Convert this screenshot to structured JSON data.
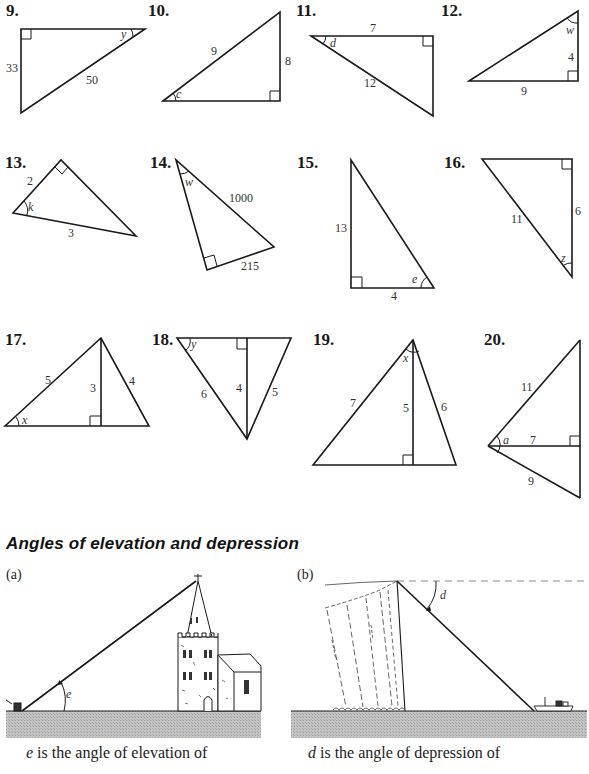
{
  "problems": [
    {
      "num": "9.",
      "labels": [
        {
          "t": "33",
          "x": 6,
          "y": 72
        },
        {
          "t": "50",
          "x": 86,
          "y": 84
        },
        {
          "t": "y",
          "x": 121,
          "y": 38,
          "i": true
        }
      ]
    },
    {
      "num": "10.",
      "labels": [
        {
          "t": "9",
          "x": 211,
          "y": 55
        },
        {
          "t": "8",
          "x": 285,
          "y": 65
        },
        {
          "t": "c",
          "x": 176,
          "y": 98,
          "i": true
        }
      ]
    },
    {
      "num": "11.",
      "labels": [
        {
          "t": "7",
          "x": 370,
          "y": 32
        },
        {
          "t": "12",
          "x": 364,
          "y": 87
        },
        {
          "t": "d",
          "x": 330,
          "y": 47,
          "i": true
        }
      ]
    },
    {
      "num": "12.",
      "labels": [
        {
          "t": "w",
          "x": 566,
          "y": 34,
          "i": true
        },
        {
          "t": "4",
          "x": 568,
          "y": 61
        },
        {
          "t": "9",
          "x": 521,
          "y": 95
        }
      ]
    },
    {
      "num": "13.",
      "labels": [
        {
          "t": "2",
          "x": 27,
          "y": 185
        },
        {
          "t": "k",
          "x": 28,
          "y": 211,
          "i": true
        },
        {
          "t": "3",
          "x": 68,
          "y": 237
        }
      ]
    },
    {
      "num": "14.",
      "labels": [
        {
          "t": "w",
          "x": 185,
          "y": 186,
          "i": true
        },
        {
          "t": "1000",
          "x": 229,
          "y": 202
        },
        {
          "t": "215",
          "x": 241,
          "y": 270
        }
      ]
    },
    {
      "num": "15.",
      "labels": [
        {
          "t": "13",
          "x": 335,
          "y": 232
        },
        {
          "t": "4",
          "x": 391,
          "y": 300
        },
        {
          "t": "e",
          "x": 412,
          "y": 283,
          "i": true
        }
      ]
    },
    {
      "num": "16.",
      "labels": [
        {
          "t": "11",
          "x": 511,
          "y": 223
        },
        {
          "t": "6",
          "x": 575,
          "y": 215
        },
        {
          "t": "z",
          "x": 561,
          "y": 262,
          "i": true
        }
      ]
    },
    {
      "num": "17.",
      "labels": [
        {
          "t": "5",
          "x": 45,
          "y": 384
        },
        {
          "t": "3",
          "x": 90,
          "y": 392
        },
        {
          "t": "4",
          "x": 129,
          "y": 385
        },
        {
          "t": "x",
          "x": 22,
          "y": 424,
          "i": true
        }
      ]
    },
    {
      "num": "18.",
      "labels": [
        {
          "t": "y",
          "x": 191,
          "y": 348,
          "i": true
        },
        {
          "t": "6",
          "x": 201,
          "y": 398
        },
        {
          "t": "4",
          "x": 236,
          "y": 392
        },
        {
          "t": "5",
          "x": 272,
          "y": 396
        }
      ]
    },
    {
      "num": "19.",
      "labels": [
        {
          "t": "x",
          "x": 403,
          "y": 362,
          "i": true
        },
        {
          "t": "7",
          "x": 350,
          "y": 407
        },
        {
          "t": "5",
          "x": 403,
          "y": 412
        },
        {
          "t": "6",
          "x": 441,
          "y": 411
        }
      ]
    },
    {
      "num": "20.",
      "labels": [
        {
          "t": "11",
          "x": 521,
          "y": 391
        },
        {
          "t": "a",
          "x": 503,
          "y": 444,
          "i": true
        },
        {
          "t": "7",
          "x": 530,
          "y": 444
        },
        {
          "t": "9",
          "x": 528,
          "y": 485
        }
      ]
    }
  ],
  "section": {
    "heading": "Angles of elevation and depression",
    "part_a": {
      "label": "(a)",
      "angle_label": "e",
      "caption_var": "e",
      "caption_text": " is the angle of elevation of"
    },
    "part_b": {
      "label": "(b)",
      "angle_label": "d",
      "caption_var": "d",
      "caption_text": " is the angle of depression of"
    }
  },
  "colors": {
    "ink": "#1a1a1a",
    "ground": "#bdbdbd",
    "ground_dark": "#a8a8a8",
    "dashed": "#888888"
  }
}
